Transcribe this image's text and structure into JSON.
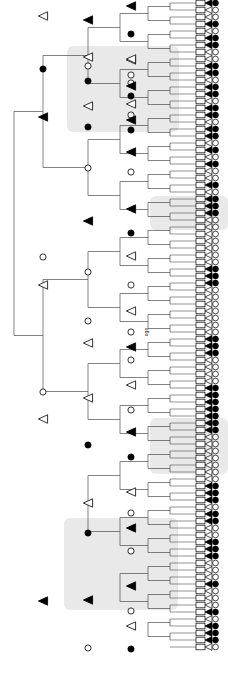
{
  "figure": {
    "type": "phylogenetic-cladogram",
    "width": 228,
    "height": 683,
    "background_color": "#ffffff",
    "branch_color": "#4d4d4d",
    "marker_outline_color": "#000000",
    "marker_fill_closed": "#000000",
    "marker_fill_open": "#ffffff",
    "highlight_color": "#e2e2e2",
    "orientation": "left-root-right-tips",
    "annotation_label": "ogo",
    "legend_note": ""
  },
  "marker_types": {
    "circle_closed": "filled-circle-node",
    "circle_open": "open-circle-node",
    "triangle_closed": "filled-triangle-node",
    "triangle_open": "open-triangle-node",
    "tip_box": "open-rectangle-tip"
  },
  "chart_data": {
    "type": "tree",
    "title": "",
    "xlabel": "",
    "ylabel": "",
    "n_tips": 92,
    "n_internal_nodes": 48,
    "annotation": "ogo",
    "highlight_bands": [
      {
        "name": "clade-highlight-1",
        "x": 67,
        "y": 46,
        "width": 112,
        "height": 86
      },
      {
        "name": "clade-highlight-2",
        "x": 150,
        "y": 196,
        "width": 78,
        "height": 34
      },
      {
        "name": "clade-highlight-3",
        "x": 150,
        "y": 418,
        "width": 78,
        "height": 56
      },
      {
        "name": "clade-highlight-4",
        "x": 64,
        "y": 518,
        "width": 114,
        "height": 92
      }
    ],
    "tip_markers": [
      {
        "i": 0,
        "y": 3,
        "triangle": "closed",
        "circle": "closed"
      },
      {
        "i": 1,
        "y": 10,
        "triangle": "open",
        "circle": "open"
      },
      {
        "i": 2,
        "y": 17,
        "triangle": "open",
        "circle": "open"
      },
      {
        "i": 3,
        "y": 24,
        "triangle": "closed",
        "circle": "closed"
      },
      {
        "i": 4,
        "y": 31,
        "triangle": "open",
        "circle": "open"
      },
      {
        "i": 5,
        "y": 38,
        "triangle": "closed",
        "circle": "closed"
      },
      {
        "i": 6,
        "y": 45,
        "triangle": "closed",
        "circle": "closed"
      },
      {
        "i": 7,
        "y": 52,
        "triangle": "open",
        "circle": "open"
      },
      {
        "i": 8,
        "y": 59,
        "triangle": "open",
        "circle": "open"
      },
      {
        "i": 9,
        "y": 66,
        "triangle": "closed",
        "circle": "closed"
      },
      {
        "i": 10,
        "y": 73,
        "triangle": "closed",
        "circle": "closed"
      },
      {
        "i": 11,
        "y": 80,
        "triangle": "open",
        "circle": "open"
      },
      {
        "i": 12,
        "y": 87,
        "triangle": "closed",
        "circle": "closed"
      },
      {
        "i": 13,
        "y": 94,
        "triangle": "closed",
        "circle": "closed"
      },
      {
        "i": 14,
        "y": 101,
        "triangle": "open",
        "circle": "open"
      },
      {
        "i": 15,
        "y": 108,
        "triangle": "closed",
        "circle": "closed"
      },
      {
        "i": 16,
        "y": 115,
        "triangle": "closed",
        "circle": "closed"
      },
      {
        "i": 17,
        "y": 122,
        "triangle": "open",
        "circle": "open"
      },
      {
        "i": 18,
        "y": 129,
        "triangle": "closed",
        "circle": "closed"
      },
      {
        "i": 19,
        "y": 136,
        "triangle": "closed",
        "circle": "closed"
      },
      {
        "i": 20,
        "y": 143,
        "triangle": "open",
        "circle": "open"
      },
      {
        "i": 21,
        "y": 150,
        "triangle": "closed",
        "circle": "closed"
      },
      {
        "i": 22,
        "y": 157,
        "triangle": "open",
        "circle": "open"
      },
      {
        "i": 23,
        "y": 164,
        "triangle": "closed",
        "circle": "closed"
      },
      {
        "i": 24,
        "y": 171,
        "triangle": "open",
        "circle": "open"
      },
      {
        "i": 25,
        "y": 178,
        "triangle": "open",
        "circle": "open"
      },
      {
        "i": 26,
        "y": 185,
        "triangle": "closed",
        "circle": "closed"
      },
      {
        "i": 27,
        "y": 192,
        "triangle": "open",
        "circle": "open"
      },
      {
        "i": 28,
        "y": 199,
        "triangle": "closed",
        "circle": "closed"
      },
      {
        "i": 29,
        "y": 206,
        "triangle": "closed",
        "circle": "closed"
      },
      {
        "i": 30,
        "y": 213,
        "triangle": "closed",
        "circle": "closed"
      },
      {
        "i": 31,
        "y": 220,
        "triangle": "open",
        "circle": "open"
      },
      {
        "i": 32,
        "y": 227,
        "triangle": "open",
        "circle": "open"
      },
      {
        "i": 33,
        "y": 234,
        "triangle": "open",
        "circle": "open"
      },
      {
        "i": 34,
        "y": 241,
        "triangle": "open",
        "circle": "open"
      },
      {
        "i": 35,
        "y": 248,
        "triangle": "open",
        "circle": "open"
      },
      {
        "i": 36,
        "y": 255,
        "triangle": "open",
        "circle": "open"
      },
      {
        "i": 37,
        "y": 262,
        "triangle": "open",
        "circle": "open"
      },
      {
        "i": 38,
        "y": 269,
        "triangle": "closed",
        "circle": "closed"
      },
      {
        "i": 39,
        "y": 276,
        "triangle": "closed",
        "circle": "closed"
      },
      {
        "i": 40,
        "y": 283,
        "triangle": "closed",
        "circle": "closed"
      },
      {
        "i": 41,
        "y": 290,
        "triangle": "open",
        "circle": "open"
      },
      {
        "i": 42,
        "y": 297,
        "triangle": "open",
        "circle": "open"
      },
      {
        "i": 43,
        "y": 304,
        "triangle": "open",
        "circle": "open"
      },
      {
        "i": 44,
        "y": 311,
        "triangle": "open",
        "circle": "open"
      },
      {
        "i": 45,
        "y": 318,
        "triangle": "open",
        "circle": "open"
      },
      {
        "i": 46,
        "y": 325,
        "triangle": "open",
        "circle": "open"
      },
      {
        "i": 47,
        "y": 332,
        "triangle": "open",
        "circle": "open"
      },
      {
        "i": 48,
        "y": 339,
        "triangle": "closed",
        "circle": "closed"
      },
      {
        "i": 49,
        "y": 346,
        "triangle": "closed",
        "circle": "closed"
      },
      {
        "i": 50,
        "y": 353,
        "triangle": "closed",
        "circle": "closed"
      },
      {
        "i": 51,
        "y": 360,
        "triangle": "open",
        "circle": "open"
      },
      {
        "i": 52,
        "y": 367,
        "triangle": "open",
        "circle": "open"
      },
      {
        "i": 53,
        "y": 374,
        "triangle": "open",
        "circle": "open"
      },
      {
        "i": 54,
        "y": 381,
        "triangle": "open",
        "circle": "open"
      },
      {
        "i": 55,
        "y": 388,
        "triangle": "closed",
        "circle": "closed"
      },
      {
        "i": 56,
        "y": 395,
        "triangle": "closed",
        "circle": "closed"
      },
      {
        "i": 57,
        "y": 402,
        "triangle": "closed",
        "circle": "closed"
      },
      {
        "i": 58,
        "y": 409,
        "triangle": "closed",
        "circle": "closed"
      },
      {
        "i": 59,
        "y": 416,
        "triangle": "closed",
        "circle": "closed"
      },
      {
        "i": 60,
        "y": 423,
        "triangle": "closed",
        "circle": "closed"
      },
      {
        "i": 61,
        "y": 430,
        "triangle": "closed",
        "circle": "closed"
      },
      {
        "i": 62,
        "y": 437,
        "triangle": "open",
        "circle": "open"
      },
      {
        "i": 63,
        "y": 444,
        "triangle": "open",
        "circle": "open"
      },
      {
        "i": 64,
        "y": 451,
        "triangle": "open",
        "circle": "open"
      },
      {
        "i": 65,
        "y": 458,
        "triangle": "open",
        "circle": "open"
      },
      {
        "i": 66,
        "y": 465,
        "triangle": "open",
        "circle": "open"
      },
      {
        "i": 67,
        "y": 472,
        "triangle": "open",
        "circle": "open"
      },
      {
        "i": 68,
        "y": 479,
        "triangle": "open",
        "circle": "open"
      },
      {
        "i": 69,
        "y": 486,
        "triangle": "closed",
        "circle": "closed"
      },
      {
        "i": 70,
        "y": 493,
        "triangle": "closed",
        "circle": "closed"
      },
      {
        "i": 71,
        "y": 500,
        "triangle": "closed",
        "circle": "closed"
      },
      {
        "i": 72,
        "y": 507,
        "triangle": "open",
        "circle": "open"
      },
      {
        "i": 73,
        "y": 514,
        "triangle": "closed",
        "circle": "closed"
      },
      {
        "i": 74,
        "y": 521,
        "triangle": "closed",
        "circle": "closed"
      },
      {
        "i": 75,
        "y": 528,
        "triangle": "open",
        "circle": "open"
      },
      {
        "i": 76,
        "y": 535,
        "triangle": "open",
        "circle": "open"
      },
      {
        "i": 77,
        "y": 542,
        "triangle": "closed",
        "circle": "closed"
      },
      {
        "i": 78,
        "y": 549,
        "triangle": "closed",
        "circle": "closed"
      },
      {
        "i": 79,
        "y": 556,
        "triangle": "closed",
        "circle": "closed"
      },
      {
        "i": 80,
        "y": 563,
        "triangle": "open",
        "circle": "open"
      },
      {
        "i": 81,
        "y": 570,
        "triangle": "open",
        "circle": "open"
      },
      {
        "i": 82,
        "y": 577,
        "triangle": "open",
        "circle": "open"
      },
      {
        "i": 83,
        "y": 584,
        "triangle": "closed",
        "circle": "closed"
      },
      {
        "i": 84,
        "y": 591,
        "triangle": "open",
        "circle": "open"
      },
      {
        "i": 85,
        "y": 598,
        "triangle": "open",
        "circle": "open"
      },
      {
        "i": 86,
        "y": 605,
        "triangle": "open",
        "circle": "open"
      },
      {
        "i": 87,
        "y": 612,
        "triangle": "closed",
        "circle": "closed"
      },
      {
        "i": 88,
        "y": 619,
        "triangle": "open",
        "circle": "open"
      },
      {
        "i": 89,
        "y": 626,
        "triangle": "closed",
        "circle": "closed"
      },
      {
        "i": 90,
        "y": 633,
        "triangle": "closed",
        "circle": "closed"
      },
      {
        "i": 91,
        "y": 640,
        "triangle": "closed",
        "circle": "closed"
      },
      {
        "i": 92,
        "y": 647,
        "triangle": "open",
        "circle": "open"
      }
    ],
    "internal_nodes": [
      {
        "name": "node-1",
        "x": 131,
        "y": 6,
        "marker": "triangle_closed"
      },
      {
        "name": "node-2",
        "x": 131,
        "y": 34,
        "marker": "circle_closed"
      },
      {
        "name": "node-3",
        "x": 88,
        "y": 20,
        "marker": "triangle_closed"
      },
      {
        "name": "node-4",
        "x": 131,
        "y": 60,
        "marker": "triangle_open"
      },
      {
        "name": "node-5",
        "x": 131,
        "y": 75,
        "marker": "circle_open"
      },
      {
        "name": "node-6",
        "x": 88,
        "y": 66,
        "marker": "circle_open"
      },
      {
        "name": "node-7",
        "x": 43,
        "y": 16,
        "marker": "triangle_open"
      },
      {
        "name": "node-8",
        "x": 131,
        "y": 59,
        "marker": "triangle_open"
      },
      {
        "name": "node-9",
        "x": 131,
        "y": 83,
        "marker": "circle_open"
      },
      {
        "name": "node-10",
        "x": 88,
        "y": 57,
        "marker": "triangle_open"
      },
      {
        "name": "node-11",
        "x": 131,
        "y": 86,
        "marker": "triangle_closed"
      },
      {
        "name": "node-12",
        "x": 131,
        "y": 96,
        "marker": "circle_closed"
      },
      {
        "name": "node-13",
        "x": 88,
        "y": 81,
        "marker": "circle_closed"
      },
      {
        "name": "node-14",
        "x": 43,
        "y": 69,
        "marker": "circle_closed"
      },
      {
        "name": "node-15",
        "x": 131,
        "y": 104,
        "marker": "triangle_open"
      },
      {
        "name": "node-16",
        "x": 131,
        "y": 115,
        "marker": "circle_open"
      },
      {
        "name": "node-17",
        "x": 88,
        "y": 106,
        "marker": "triangle_open"
      },
      {
        "name": "node-18",
        "x": 131,
        "y": 120,
        "marker": "triangle_closed"
      },
      {
        "name": "node-19",
        "x": 131,
        "y": 130,
        "marker": "circle_closed"
      },
      {
        "name": "node-20",
        "x": 88,
        "y": 127,
        "marker": "circle_closed"
      },
      {
        "name": "node-21",
        "x": 43,
        "y": 117,
        "marker": "triangle_closed"
      },
      {
        "name": "node-22",
        "x": 131,
        "y": 152,
        "marker": "triangle_closed"
      },
      {
        "name": "node-23",
        "x": 131,
        "y": 172,
        "marker": "circle_open"
      },
      {
        "name": "node-24",
        "x": 88,
        "y": 168,
        "marker": "circle_open"
      },
      {
        "name": "node-25",
        "x": 131,
        "y": 209,
        "marker": "triangle_closed"
      },
      {
        "name": "node-26",
        "x": 131,
        "y": 233,
        "marker": "circle_closed"
      },
      {
        "name": "node-27",
        "x": 88,
        "y": 221,
        "marker": "triangle_closed"
      },
      {
        "name": "node-28",
        "x": 131,
        "y": 256,
        "marker": "triangle_open"
      },
      {
        "name": "node-29",
        "x": 131,
        "y": 285,
        "marker": "circle_open"
      },
      {
        "name": "node-30",
        "x": 88,
        "y": 272,
        "marker": "circle_open"
      },
      {
        "name": "node-31",
        "x": 131,
        "y": 311,
        "marker": "triangle_open"
      },
      {
        "name": "node-32",
        "x": 131,
        "y": 332,
        "marker": "circle_open"
      },
      {
        "name": "node-33",
        "x": 88,
        "y": 321,
        "marker": "circle_open"
      },
      {
        "name": "node-34",
        "x": 43,
        "y": 257,
        "marker": "circle_open"
      },
      {
        "name": "node-35",
        "x": 43,
        "y": 285,
        "marker": "triangle_open"
      },
      {
        "name": "node-36",
        "x": 131,
        "y": 347,
        "marker": "triangle_closed"
      },
      {
        "name": "node-37",
        "x": 131,
        "y": 360,
        "marker": "circle_open"
      },
      {
        "name": "node-38",
        "x": 88,
        "y": 343,
        "marker": "triangle_open"
      },
      {
        "name": "node-39",
        "x": 131,
        "y": 385,
        "marker": "triangle_open"
      },
      {
        "name": "node-40",
        "x": 131,
        "y": 410,
        "marker": "circle_open"
      },
      {
        "name": "node-41",
        "x": 88,
        "y": 398,
        "marker": "triangle_open"
      },
      {
        "name": "node-42",
        "x": 131,
        "y": 432,
        "marker": "triangle_closed"
      },
      {
        "name": "node-43",
        "x": 131,
        "y": 457,
        "marker": "circle_closed"
      },
      {
        "name": "node-44",
        "x": 88,
        "y": 445,
        "marker": "circle_closed"
      },
      {
        "name": "node-45",
        "x": 131,
        "y": 492,
        "marker": "triangle_open"
      },
      {
        "name": "node-46",
        "x": 131,
        "y": 513,
        "marker": "circle_open"
      },
      {
        "name": "node-47",
        "x": 88,
        "y": 503,
        "marker": "triangle_open"
      },
      {
        "name": "node-48",
        "x": 131,
        "y": 528,
        "marker": "triangle_closed"
      },
      {
        "name": "node-49",
        "x": 131,
        "y": 551,
        "marker": "circle_open"
      },
      {
        "name": "node-50",
        "x": 88,
        "y": 533,
        "marker": "circle_closed"
      },
      {
        "name": "node-51",
        "x": 131,
        "y": 586,
        "marker": "triangle_closed"
      },
      {
        "name": "node-52",
        "x": 131,
        "y": 611,
        "marker": "circle_open"
      },
      {
        "name": "node-53",
        "x": 88,
        "y": 600,
        "marker": "triangle_closed"
      },
      {
        "name": "node-54",
        "x": 131,
        "y": 626,
        "marker": "triangle_open"
      },
      {
        "name": "node-55",
        "x": 131,
        "y": 649,
        "marker": "circle_closed"
      },
      {
        "name": "node-56",
        "x": 88,
        "y": 648,
        "marker": "circle_open"
      },
      {
        "name": "node-57",
        "x": 43,
        "y": 392,
        "marker": "circle_open"
      },
      {
        "name": "node-58",
        "x": 43,
        "y": 419,
        "marker": "triangle_open"
      },
      {
        "name": "node-59",
        "x": 43,
        "y": 601,
        "marker": "triangle_closed"
      }
    ]
  }
}
